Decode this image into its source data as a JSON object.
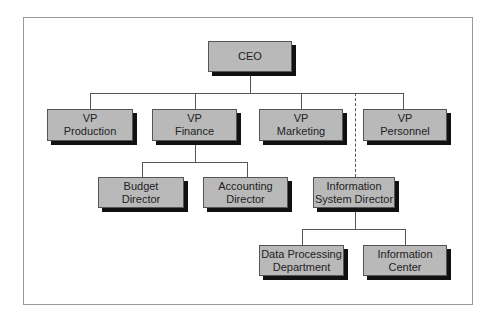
{
  "chart": {
    "type": "org-chart",
    "connector_color": "#555555",
    "box_fill": "#b9b9b9",
    "shadow_color": "#111111"
  },
  "nodes": {
    "ceo": {
      "line1": "CEO",
      "line2": ""
    },
    "vp_production": {
      "line1": "VP",
      "line2": "Production"
    },
    "vp_finance": {
      "line1": "VP",
      "line2": "Finance"
    },
    "vp_marketing": {
      "line1": "VP",
      "line2": "Marketing"
    },
    "vp_personnel": {
      "line1": "VP",
      "line2": "Personnel"
    },
    "budget_director": {
      "line1": "Budget",
      "line2": "Director"
    },
    "accounting_director": {
      "line1": "Accounting",
      "line2": "Director"
    },
    "info_system_director": {
      "line1": "Information",
      "line2": "System Director"
    },
    "data_processing": {
      "line1": "Data Processing",
      "line2": "Department"
    },
    "information_center": {
      "line1": "Information",
      "line2": "Center"
    }
  },
  "relationships": [
    {
      "from": "CEO",
      "to": "VP Production",
      "style": "solid"
    },
    {
      "from": "CEO",
      "to": "VP Finance",
      "style": "solid"
    },
    {
      "from": "CEO",
      "to": "VP Marketing",
      "style": "solid"
    },
    {
      "from": "CEO",
      "to": "VP Personnel",
      "style": "solid"
    },
    {
      "from": "CEO",
      "to": "Information System Director",
      "style": "dashed"
    },
    {
      "from": "VP Finance",
      "to": "Budget Director",
      "style": "solid"
    },
    {
      "from": "VP Finance",
      "to": "Accounting Director",
      "style": "solid"
    },
    {
      "from": "Information System Director",
      "to": "Data Processing Department",
      "style": "solid"
    },
    {
      "from": "Information System Director",
      "to": "Information Center",
      "style": "solid"
    }
  ]
}
